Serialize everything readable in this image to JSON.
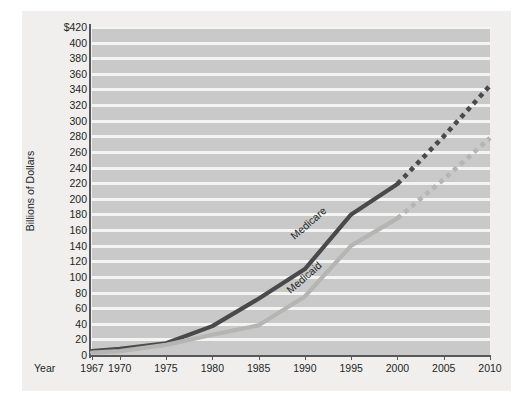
{
  "chart_data": {
    "type": "line",
    "title": "",
    "subtitle": "",
    "xlabel": "Year",
    "ylabel": "Billions of Dollars",
    "xlim": [
      1967,
      2010
    ],
    "ylim": [
      0,
      420
    ],
    "grid": "horizontal-bands",
    "legend_position": "inline-series-labels",
    "yticks": [
      "$420",
      "400",
      "380",
      "360",
      "340",
      "320",
      "300",
      "280",
      "260",
      "240",
      "220",
      "200",
      "180",
      "160",
      "140",
      "120",
      "100",
      "80",
      "60",
      "40",
      "20",
      "0"
    ],
    "ytick_values": [
      420,
      400,
      380,
      360,
      340,
      320,
      300,
      280,
      260,
      240,
      220,
      200,
      180,
      160,
      140,
      120,
      100,
      80,
      60,
      40,
      20,
      0
    ],
    "xticks": [
      "1967",
      "1970",
      "1975",
      "1980",
      "1985",
      "1990",
      "1995",
      "2000",
      "2005",
      "2010"
    ],
    "xtick_values": [
      1967,
      1970,
      1975,
      1980,
      1985,
      1990,
      1995,
      2000,
      2005,
      2010
    ],
    "series": [
      {
        "name": "Medicare",
        "color": "#4a4a4c",
        "x": [
          1967,
          1970,
          1975,
          1980,
          1985,
          1990,
          1995,
          2000
        ],
        "values": [
          5,
          8,
          15,
          37,
          72,
          110,
          180,
          219
        ],
        "projection": {
          "style": "dotted",
          "x": [
            2000,
            2005,
            2010
          ],
          "values": [
            219,
            280,
            345
          ]
        }
      },
      {
        "name": "Medicaid",
        "color": "#b5b5b3",
        "x": [
          1967,
          1970,
          1975,
          1980,
          1985,
          1990,
          1995,
          2000
        ],
        "values": [
          3,
          5,
          13,
          26,
          38,
          75,
          140,
          175
        ],
        "projection": {
          "style": "dotted",
          "x": [
            2000,
            2005,
            2010
          ],
          "values": [
            175,
            225,
            278
          ]
        }
      }
    ]
  },
  "axes": {
    "ylabel": "Billions of Dollars",
    "xlabel": "Year"
  },
  "labels": {
    "medicare": "Medicare",
    "medicaid": "Medicaid"
  }
}
